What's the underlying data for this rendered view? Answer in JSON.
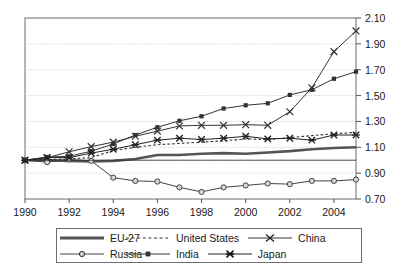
{
  "chart_data": {
    "type": "line",
    "title": "",
    "xlabel": "",
    "ylabel": "",
    "xlim": [
      1990,
      2005
    ],
    "ylim": [
      0.7,
      2.1
    ],
    "grid": true,
    "legend_position": "bottom",
    "x": [
      1990,
      1991,
      1992,
      1993,
      1994,
      1995,
      1996,
      1997,
      1998,
      1999,
      2000,
      2001,
      2002,
      2003,
      2004,
      2005
    ],
    "xticks": [
      "1990",
      "1992",
      "1994",
      "1996",
      "1998",
      "2000",
      "2002",
      "2004"
    ],
    "yticks": [
      "2.10",
      "1.90",
      "1.70",
      "1.50",
      "1.30",
      "1.10",
      "0.90",
      "0.70"
    ],
    "series": [
      {
        "name": "EU-27",
        "marker": "none",
        "line": "thick-solid",
        "color": "#555555",
        "values": [
          1.0,
          1.0,
          0.995,
          0.99,
          0.995,
          1.01,
          1.04,
          1.04,
          1.05,
          1.055,
          1.05,
          1.06,
          1.07,
          1.085,
          1.095,
          1.1
        ]
      },
      {
        "name": "United States",
        "marker": "none",
        "line": "dashed",
        "color": "#333333",
        "values": [
          1.0,
          1.005,
          1.01,
          1.02,
          1.075,
          1.1,
          1.12,
          1.13,
          1.14,
          1.15,
          1.165,
          1.16,
          1.175,
          1.19,
          1.205,
          1.215
        ]
      },
      {
        "name": "China",
        "marker": "x",
        "line": "solid",
        "color": "#333333",
        "values": [
          1.0,
          1.02,
          1.065,
          1.105,
          1.14,
          1.185,
          1.225,
          1.265,
          1.27,
          1.27,
          1.275,
          1.27,
          1.375,
          1.56,
          1.84,
          2.0
        ]
      },
      {
        "name": "Russia",
        "marker": "circle",
        "line": "solid",
        "color": "#444444",
        "values": [
          1.0,
          0.985,
          1.005,
          0.995,
          0.865,
          0.84,
          0.835,
          0.79,
          0.755,
          0.79,
          0.805,
          0.82,
          0.815,
          0.84,
          0.84,
          0.85
        ]
      },
      {
        "name": "India",
        "marker": "square",
        "line": "solid",
        "color": "#333333",
        "values": [
          1.0,
          1.025,
          1.03,
          1.07,
          1.125,
          1.195,
          1.255,
          1.305,
          1.34,
          1.4,
          1.425,
          1.44,
          1.505,
          1.545,
          1.63,
          1.685
        ]
      },
      {
        "name": "Japan",
        "marker": "asterisk",
        "line": "solid",
        "color": "#222222",
        "values": [
          1.0,
          1.02,
          1.02,
          1.055,
          1.085,
          1.12,
          1.155,
          1.17,
          1.16,
          1.17,
          1.185,
          1.165,
          1.17,
          1.155,
          1.195,
          1.195
        ]
      },
      {
        "name": "baseline",
        "marker": "none",
        "line": "thin-solid",
        "color": "#333333",
        "values": [
          1.0,
          1.0,
          1.0,
          1.0,
          1.0,
          1.0,
          1.0,
          1.0,
          1.0,
          1.0,
          1.0,
          1.0,
          1.0,
          1.0,
          1.0,
          1.0
        ]
      }
    ]
  },
  "legend": {
    "rows": [
      [
        {
          "label": "EU-27",
          "marker": "none",
          "line": "thick-solid"
        },
        {
          "label": "United States",
          "marker": "none",
          "line": "dashed"
        },
        {
          "label": "China",
          "marker": "x",
          "line": "solid"
        }
      ],
      [
        {
          "label": "Russia",
          "marker": "circle",
          "line": "solid"
        },
        {
          "label": "India",
          "marker": "square",
          "line": "solid"
        },
        {
          "label": "Japan",
          "marker": "asterisk",
          "line": "solid"
        }
      ]
    ]
  },
  "axes": {
    "y_labels": [
      "2.10",
      "1.90",
      "1.70",
      "1.50",
      "1.30",
      "1.10",
      "0.90",
      "0.70"
    ],
    "x_labels": [
      "1990",
      "1992",
      "1994",
      "1996",
      "1998",
      "2000",
      "2002",
      "2004"
    ]
  }
}
